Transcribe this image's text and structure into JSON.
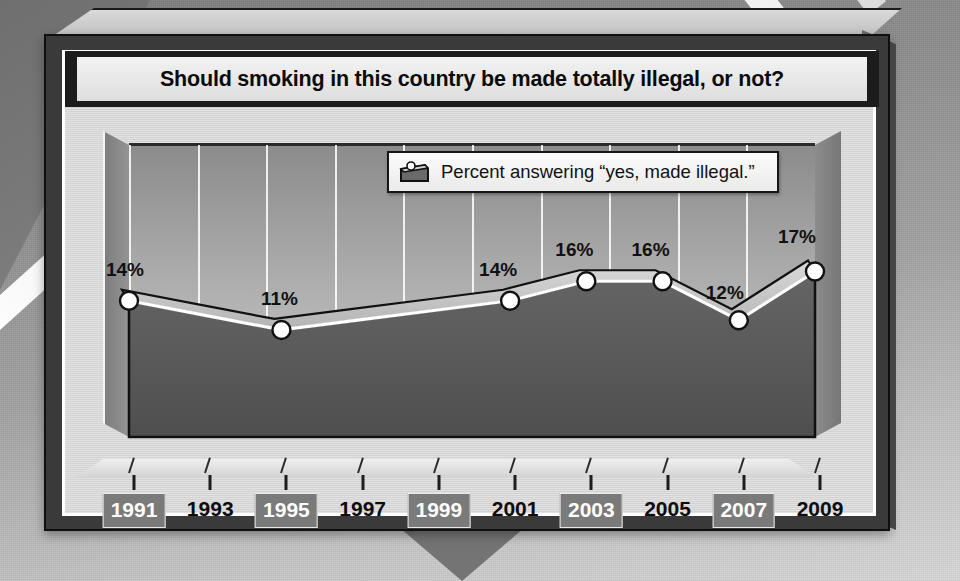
{
  "card": {
    "title": "Should smoking in this country be made totally illegal, or not?"
  },
  "legend": {
    "icon": "area-series-swatch-icon",
    "label": "Percent answering “yes, made illegal.”"
  },
  "colors": {
    "frame_dark": "#3a3a3a",
    "panel_light": "#d6d6d6",
    "title_plate": "#f2f2f2",
    "area_fill": "#5a5a5a",
    "ribbon_top": "#c9c9c9",
    "line_stroke": "#ffffff",
    "marker_fill": "#ffffff",
    "marker_stroke": "#111111",
    "label_highlight_bg": "#7a7a7a",
    "background": "#9a9a9a"
  },
  "chart_data": {
    "type": "line",
    "title": "Should smoking in this country be made totally illegal, or not?",
    "xlabel": "",
    "ylabel": "",
    "ylim": [
      0,
      30
    ],
    "grid": true,
    "legend_position": "top-right",
    "series_name": "Percent answering “yes, made illegal.”",
    "x": [
      1991,
      1993,
      1995,
      1997,
      1999,
      2001,
      2003,
      2005,
      2007,
      2009
    ],
    "categories": [
      "1991",
      "1993",
      "1995",
      "1997",
      "1999",
      "2001",
      "2003",
      "2005",
      "2007",
      "2009"
    ],
    "values": [
      14,
      12.5,
      11,
      12,
      13,
      14,
      16,
      16,
      12,
      17
    ],
    "labeled_points": [
      {
        "year": "1991",
        "value": 14,
        "label": "14%"
      },
      {
        "year": "1995",
        "value": 11,
        "label": "11%"
      },
      {
        "year": "2001",
        "value": 14,
        "label": "14%"
      },
      {
        "year": "2003",
        "value": 16,
        "label": "16%"
      },
      {
        "year": "2005",
        "value": 16,
        "label": "16%"
      },
      {
        "year": "2007",
        "value": 12,
        "label": "12%"
      },
      {
        "year": "2009",
        "value": 17,
        "label": "17%"
      }
    ],
    "series": [
      {
        "name": "Percent answering “yes, made illegal.”",
        "values": [
          14,
          12.5,
          11,
          12,
          13,
          14,
          16,
          16,
          12,
          17
        ]
      }
    ],
    "tick_labels": [
      "1991",
      "1993",
      "1995",
      "1997",
      "1999",
      "2001",
      "2003",
      "2005",
      "2007",
      "2009"
    ],
    "highlighted_ticks": [
      "1991",
      "1995",
      "1999",
      "2003",
      "2007"
    ]
  },
  "axis": {
    "labels": [
      {
        "text": "1991",
        "highlighted": true
      },
      {
        "text": "1993",
        "highlighted": false
      },
      {
        "text": "1995",
        "highlighted": true
      },
      {
        "text": "1997",
        "highlighted": false
      },
      {
        "text": "1999",
        "highlighted": true
      },
      {
        "text": "2001",
        "highlighted": false
      },
      {
        "text": "2003",
        "highlighted": true
      },
      {
        "text": "2005",
        "highlighted": false
      },
      {
        "text": "2007",
        "highlighted": true
      },
      {
        "text": "2009",
        "highlighted": false
      }
    ]
  }
}
